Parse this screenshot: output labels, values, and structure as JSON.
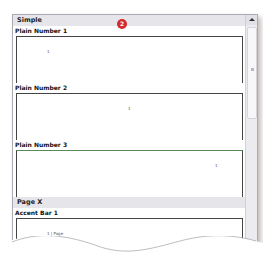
{
  "callout_badge": "2",
  "sections": [
    {
      "header": "Simple",
      "items": [
        {
          "label": "Plain Number 1",
          "mark": "1"
        },
        {
          "label": "Plain Number 2",
          "mark": "1"
        },
        {
          "label": "Plain Number 3",
          "mark": "1"
        }
      ]
    },
    {
      "header": "Page X",
      "items": [
        {
          "label": "Accent Bar 1",
          "mark": "1 | Page"
        }
      ]
    }
  ],
  "colors": {
    "badge": "#d42a2a",
    "section_header_bg": "#e6e6ea"
  }
}
